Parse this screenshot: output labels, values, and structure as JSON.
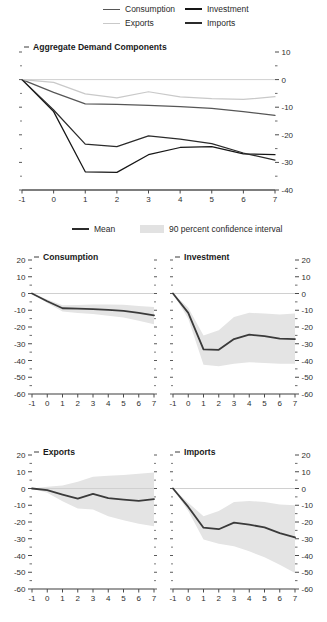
{
  "figure": {
    "background": "#ffffff",
    "width": 327,
    "height": 622
  },
  "top_legend": {
    "items": [
      {
        "label": "Consumption",
        "color": "#565656",
        "swatch": "line"
      },
      {
        "label": "Investment",
        "color": "#161616",
        "swatch": "line"
      },
      {
        "label": "Exports",
        "color": "#c9c9c9",
        "swatch": "line"
      },
      {
        "label": "Imports",
        "color": "#2b2b2b",
        "swatch": "line"
      }
    ]
  },
  "mid_legend": {
    "items": [
      {
        "label": "Mean",
        "color": "#2b2b2b",
        "swatch": "line"
      },
      {
        "label": "90 percent confidence interval",
        "color": "#e2e2e2",
        "swatch": "band"
      }
    ]
  },
  "chart_data": [
    {
      "id": "aggregate-demand-components",
      "type": "line",
      "title": "Aggregate Demand Components",
      "xlabel": "",
      "ylabel": "",
      "x": [
        -1,
        0,
        1,
        2,
        3,
        4,
        5,
        6,
        7
      ],
      "xlim": [
        -1,
        7
      ],
      "ylim": [
        -40,
        10
      ],
      "yticks": [
        10,
        0,
        -10,
        -20,
        -30,
        -40
      ],
      "ytick_labels": [
        "10",
        "0",
        "-10",
        "-20",
        "-30",
        "-40"
      ],
      "xtick_labels": [
        "-1",
        "0",
        "1",
        "2",
        "3",
        "4",
        "5",
        "6",
        "7"
      ],
      "yaxis_side": "right",
      "grid": false,
      "zero_line": true,
      "legend": "top",
      "series": [
        {
          "name": "Consumption",
          "color": "#565656",
          "values": [
            0,
            -4.6,
            -8.8,
            -9.0,
            -9.3,
            -9.8,
            -10.4,
            -11.6,
            -13.0
          ]
        },
        {
          "name": "Investment",
          "color": "#161616",
          "values": [
            0,
            -11.6,
            -33.4,
            -33.6,
            -27.2,
            -24.6,
            -24.3,
            -26.9,
            -27.2
          ]
        },
        {
          "name": "Exports",
          "color": "#c9c9c9",
          "values": [
            0,
            -1.0,
            -5.2,
            -6.6,
            -4.4,
            -6.3,
            -6.9,
            -7.2,
            -6.2
          ]
        },
        {
          "name": "Imports",
          "color": "#2b2b2b",
          "values": [
            0,
            -11.0,
            -23.4,
            -24.3,
            -20.4,
            -21.6,
            -23.2,
            -26.6,
            -29.2
          ]
        }
      ]
    },
    {
      "id": "consumption",
      "type": "line",
      "title": "Consumption",
      "xlabel": "",
      "ylabel": "",
      "x": [
        -1,
        0,
        1,
        2,
        3,
        4,
        5,
        6,
        7
      ],
      "xlim": [
        -1,
        7
      ],
      "ylim": [
        -60,
        20
      ],
      "yticks": [
        20,
        10,
        0,
        -10,
        -20,
        -30,
        -40,
        -50,
        -60
      ],
      "ytick_labels": [
        "20",
        "10",
        "0",
        "-10",
        "-20",
        "-30",
        "-40",
        "-50",
        "-60"
      ],
      "xtick_labels": [
        "-1",
        "0",
        "1",
        "2",
        "3",
        "4",
        "5",
        "6",
        "7"
      ],
      "yaxis_side": "left",
      "grid": false,
      "zero_line": true,
      "series": [
        {
          "name": "Mean",
          "color": "#3a3a3a",
          "values": [
            0,
            -4.6,
            -8.8,
            -9.0,
            -9.3,
            -9.8,
            -10.4,
            -11.6,
            -13.0
          ]
        }
      ],
      "band": {
        "name": "90 percent confidence interval",
        "color": "#e4e4e4",
        "lower": [
          0,
          -5.6,
          -10.8,
          -11.6,
          -12.3,
          -13.3,
          -14.4,
          -16.2,
          -18.4
        ],
        "upper": [
          0,
          -3.6,
          -7.0,
          -6.8,
          -6.6,
          -6.6,
          -6.7,
          -7.4,
          -8.0
        ]
      }
    },
    {
      "id": "investment",
      "type": "line",
      "title": "Investment",
      "xlabel": "",
      "ylabel": "",
      "x": [
        -1,
        0,
        1,
        2,
        3,
        4,
        5,
        6,
        7
      ],
      "xlim": [
        -1,
        7
      ],
      "ylim": [
        -60,
        20
      ],
      "yticks": [
        20,
        10,
        0,
        -10,
        -20,
        -30,
        -40,
        -50,
        -60
      ],
      "ytick_labels": [
        "20",
        "10",
        "0",
        "-10",
        "-20",
        "-30",
        "-40",
        "-50",
        "-60"
      ],
      "xtick_labels": [
        "-1",
        "0",
        "1",
        "2",
        "3",
        "4",
        "5",
        "6",
        "7"
      ],
      "yaxis_side": "right",
      "grid": false,
      "zero_line": true,
      "series": [
        {
          "name": "Mean",
          "color": "#3a3a3a",
          "values": [
            0,
            -11.6,
            -33.4,
            -33.6,
            -27.2,
            -24.6,
            -25.4,
            -26.9,
            -27.2
          ]
        }
      ],
      "band": {
        "name": "90 percent confidence interval",
        "color": "#e4e4e4",
        "lower": [
          0,
          -15.0,
          -42.5,
          -43.5,
          -42.0,
          -41.0,
          -41.5,
          -42.0,
          -42.0
        ],
        "upper": [
          0,
          -8.5,
          -25.0,
          -22.0,
          -14.0,
          -11.5,
          -12.0,
          -12.5,
          -12.0
        ]
      }
    },
    {
      "id": "exports",
      "type": "line",
      "title": "Exports",
      "xlabel": "",
      "ylabel": "",
      "x": [
        -1,
        0,
        1,
        2,
        3,
        4,
        5,
        6,
        7
      ],
      "xlim": [
        -1,
        7
      ],
      "ylim": [
        -60,
        20
      ],
      "yticks": [
        20,
        10,
        0,
        -10,
        -20,
        -30,
        -40,
        -50,
        -60
      ],
      "ytick_labels": [
        "20",
        "10",
        "0",
        "-10",
        "-20",
        "-30",
        "-40",
        "-50",
        "-60"
      ],
      "xtick_labels": [
        "-1",
        "0",
        "1",
        "2",
        "3",
        "4",
        "5",
        "6",
        "7"
      ],
      "yaxis_side": "left",
      "grid": false,
      "zero_line": true,
      "series": [
        {
          "name": "Mean",
          "color": "#3a3a3a",
          "values": [
            0,
            -1.0,
            -3.6,
            -6.0,
            -3.2,
            -5.8,
            -6.6,
            -7.4,
            -6.4
          ]
        }
      ],
      "band": {
        "name": "90 percent confidence interval",
        "color": "#e4e4e4",
        "lower": [
          0,
          -2.6,
          -7.6,
          -12.0,
          -12.5,
          -16.5,
          -19.0,
          -21.0,
          -22.5
        ],
        "upper": [
          0,
          1.0,
          1.8,
          4.0,
          7.0,
          7.6,
          8.0,
          8.8,
          9.5
        ]
      }
    },
    {
      "id": "imports",
      "type": "line",
      "title": "Imports",
      "xlabel": "",
      "ylabel": "",
      "x": [
        -1,
        0,
        1,
        2,
        3,
        4,
        5,
        6,
        7
      ],
      "xlim": [
        -1,
        7
      ],
      "ylim": [
        -60,
        20
      ],
      "yticks": [
        20,
        10,
        0,
        -10,
        -20,
        -30,
        -40,
        -50,
        -60
      ],
      "ytick_labels": [
        "20",
        "10",
        "0",
        "-10",
        "-20",
        "-30",
        "-40",
        "-50",
        "-60"
      ],
      "xtick_labels": [
        "-1",
        "0",
        "1",
        "2",
        "3",
        "4",
        "5",
        "6",
        "7"
      ],
      "yaxis_side": "right",
      "grid": false,
      "zero_line": true,
      "series": [
        {
          "name": "Mean",
          "color": "#3a3a3a",
          "values": [
            0,
            -11.0,
            -23.4,
            -24.3,
            -20.4,
            -21.6,
            -23.2,
            -26.6,
            -29.2
          ]
        }
      ],
      "band": {
        "name": "90 percent confidence interval",
        "color": "#e4e4e4",
        "lower": [
          0,
          -13.5,
          -30.5,
          -33.0,
          -34.5,
          -37.5,
          -41.0,
          -45.5,
          -50.5
        ],
        "upper": [
          0,
          -8.5,
          -16.5,
          -13.5,
          -8.0,
          -7.5,
          -8.0,
          -9.5,
          -10.0
        ]
      }
    }
  ]
}
